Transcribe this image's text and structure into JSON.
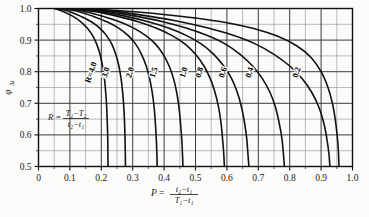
{
  "chart_data": {
    "type": "line",
    "title": "",
    "xlabel": "P = (t2-t1)/(T1-t1)",
    "ylabel": "phi_dt",
    "xlim": [
      0.0,
      1.0
    ],
    "ylim": [
      0.5,
      1.0
    ],
    "grid": true,
    "grid_major_x": 0.1,
    "grid_minor_x": 0.05,
    "grid_major_y": 0.1,
    "grid_minor_y": 0.05,
    "legend": "inline-curve-labels",
    "x_ticks": [
      "0",
      "0.1",
      "0.2",
      "0.3",
      "0.4",
      "0.5",
      "0.6",
      "0.7",
      "0.8",
      "0.9",
      "1.0"
    ],
    "x_tick_values": [
      0.0,
      0.1,
      0.2,
      0.3,
      0.4,
      0.5,
      0.6,
      0.7,
      0.8,
      0.9,
      1.0
    ],
    "y_ticks": [
      "0.5",
      "0.6",
      "0.7",
      "0.8",
      "0.9",
      "1.0"
    ],
    "y_tick_values": [
      0.5,
      0.6,
      0.7,
      0.8,
      0.9,
      1.0
    ],
    "series": [
      {
        "name": "R=4.0",
        "label": "R=4.0",
        "label_x": 0.175,
        "label_y": 0.795,
        "points": [
          [
            0.05,
            1.0
          ],
          [
            0.08,
            0.99
          ],
          [
            0.11,
            0.975
          ],
          [
            0.135,
            0.958
          ],
          [
            0.155,
            0.938
          ],
          [
            0.172,
            0.915
          ],
          [
            0.185,
            0.888
          ],
          [
            0.196,
            0.855
          ],
          [
            0.204,
            0.818
          ],
          [
            0.21,
            0.778
          ],
          [
            0.214,
            0.735
          ],
          [
            0.217,
            0.69
          ],
          [
            0.219,
            0.64
          ],
          [
            0.2205,
            0.59
          ],
          [
            0.221,
            0.54
          ],
          [
            0.2215,
            0.5
          ]
        ]
      },
      {
        "name": "3.0",
        "label": "3.0",
        "label_x": 0.222,
        "label_y": 0.795,
        "points": [
          [
            0.06,
            1.0
          ],
          [
            0.1,
            0.99
          ],
          [
            0.135,
            0.975
          ],
          [
            0.168,
            0.958
          ],
          [
            0.195,
            0.938
          ],
          [
            0.216,
            0.915
          ],
          [
            0.233,
            0.888
          ],
          [
            0.246,
            0.855
          ],
          [
            0.256,
            0.818
          ],
          [
            0.263,
            0.778
          ],
          [
            0.268,
            0.735
          ],
          [
            0.2715,
            0.69
          ],
          [
            0.274,
            0.64
          ],
          [
            0.2755,
            0.59
          ],
          [
            0.2765,
            0.54
          ],
          [
            0.277,
            0.5
          ]
        ]
      },
      {
        "name": "2.0",
        "label": "2.0",
        "label_x": 0.3,
        "label_y": 0.795,
        "points": [
          [
            0.075,
            1.0
          ],
          [
            0.128,
            0.99
          ],
          [
            0.175,
            0.975
          ],
          [
            0.218,
            0.958
          ],
          [
            0.255,
            0.938
          ],
          [
            0.285,
            0.915
          ],
          [
            0.309,
            0.888
          ],
          [
            0.328,
            0.855
          ],
          [
            0.343,
            0.818
          ],
          [
            0.354,
            0.778
          ],
          [
            0.362,
            0.735
          ],
          [
            0.368,
            0.69
          ],
          [
            0.372,
            0.64
          ],
          [
            0.375,
            0.59
          ],
          [
            0.377,
            0.54
          ],
          [
            0.378,
            0.5
          ]
        ]
      },
      {
        "name": "1.5",
        "label": "1.5",
        "label_x": 0.375,
        "label_y": 0.795,
        "points": [
          [
            0.088,
            1.0
          ],
          [
            0.15,
            0.99
          ],
          [
            0.207,
            0.975
          ],
          [
            0.258,
            0.958
          ],
          [
            0.303,
            0.938
          ],
          [
            0.341,
            0.915
          ],
          [
            0.372,
            0.888
          ],
          [
            0.397,
            0.855
          ],
          [
            0.416,
            0.818
          ],
          [
            0.43,
            0.778
          ],
          [
            0.44,
            0.735
          ],
          [
            0.447,
            0.69
          ],
          [
            0.452,
            0.64
          ],
          [
            0.456,
            0.59
          ],
          [
            0.4585,
            0.54
          ],
          [
            0.46,
            0.5
          ]
        ]
      },
      {
        "name": "1.0",
        "label": "1.0",
        "label_x": 0.47,
        "label_y": 0.795,
        "points": [
          [
            0.105,
            1.0
          ],
          [
            0.182,
            0.99
          ],
          [
            0.253,
            0.975
          ],
          [
            0.317,
            0.958
          ],
          [
            0.374,
            0.938
          ],
          [
            0.424,
            0.915
          ],
          [
            0.466,
            0.888
          ],
          [
            0.5,
            0.855
          ],
          [
            0.527,
            0.818
          ],
          [
            0.547,
            0.778
          ],
          [
            0.562,
            0.735
          ],
          [
            0.573,
            0.69
          ],
          [
            0.581,
            0.64
          ],
          [
            0.586,
            0.59
          ],
          [
            0.59,
            0.54
          ],
          [
            0.592,
            0.5
          ]
        ]
      },
      {
        "name": "0.8",
        "label": "0.8",
        "label_x": 0.52,
        "label_y": 0.795,
        "points": [
          [
            0.115,
            1.0
          ],
          [
            0.2,
            0.99
          ],
          [
            0.279,
            0.975
          ],
          [
            0.35,
            0.958
          ],
          [
            0.414,
            0.938
          ],
          [
            0.47,
            0.915
          ],
          [
            0.518,
            0.888
          ],
          [
            0.558,
            0.855
          ],
          [
            0.59,
            0.818
          ],
          [
            0.615,
            0.778
          ],
          [
            0.633,
            0.735
          ],
          [
            0.646,
            0.69
          ],
          [
            0.656,
            0.64
          ],
          [
            0.663,
            0.59
          ],
          [
            0.667,
            0.54
          ],
          [
            0.67,
            0.5
          ]
        ]
      },
      {
        "name": "0.6",
        "label": "0.6",
        "label_x": 0.595,
        "label_y": 0.795,
        "points": [
          [
            0.128,
            1.0
          ],
          [
            0.224,
            0.99
          ],
          [
            0.314,
            0.975
          ],
          [
            0.396,
            0.958
          ],
          [
            0.47,
            0.938
          ],
          [
            0.536,
            0.915
          ],
          [
            0.594,
            0.888
          ],
          [
            0.642,
            0.855
          ],
          [
            0.682,
            0.818
          ],
          [
            0.713,
            0.778
          ],
          [
            0.737,
            0.735
          ],
          [
            0.754,
            0.69
          ],
          [
            0.766,
            0.64
          ],
          [
            0.775,
            0.59
          ],
          [
            0.78,
            0.54
          ],
          [
            0.783,
            0.5
          ]
        ]
      },
      {
        "name": "0.4",
        "label": "0.4",
        "label_x": 0.68,
        "label_y": 0.795,
        "points": [
          [
            0.14,
            1.0
          ],
          [
            0.25,
            0.99
          ],
          [
            0.355,
            0.975
          ],
          [
            0.452,
            0.958
          ],
          [
            0.54,
            0.938
          ],
          [
            0.62,
            0.915
          ],
          [
            0.69,
            0.888
          ],
          [
            0.75,
            0.855
          ],
          [
            0.8,
            0.818
          ],
          [
            0.84,
            0.778
          ],
          [
            0.87,
            0.735
          ],
          [
            0.892,
            0.69
          ],
          [
            0.908,
            0.64
          ],
          [
            0.918,
            0.59
          ],
          [
            0.925,
            0.54
          ],
          [
            0.928,
            0.5
          ]
        ]
      },
      {
        "name": "0.2",
        "label": "0.2",
        "label_x": 0.83,
        "label_y": 0.795,
        "points": [
          [
            0.15,
            1.0
          ],
          [
            0.272,
            0.992
          ],
          [
            0.39,
            0.982
          ],
          [
            0.5,
            0.97
          ],
          [
            0.6,
            0.955
          ],
          [
            0.688,
            0.936
          ],
          [
            0.762,
            0.912
          ],
          [
            0.822,
            0.882
          ],
          [
            0.868,
            0.845
          ],
          [
            0.9,
            0.8
          ],
          [
            0.922,
            0.75
          ],
          [
            0.936,
            0.7
          ],
          [
            0.945,
            0.65
          ],
          [
            0.951,
            0.6
          ],
          [
            0.955,
            0.55
          ],
          [
            0.957,
            0.5
          ]
        ]
      }
    ],
    "annotations": [
      {
        "name": "r-definition",
        "text": "R = (T1-T2)/(t2-t1)",
        "symbol": "R",
        "numerator": "T1-T2",
        "denominator": "t2-t1",
        "x": 0.15,
        "y": 0.65
      }
    ]
  },
  "axis": {
    "y_label_symbol": "φ",
    "y_label_subscript": "Δt",
    "x_label_symbol": "P",
    "x_label_numerator": "t₂−t₁",
    "x_label_denominator": "T₁−t₁",
    "equals": "="
  },
  "annotation_r": {
    "symbol": "R",
    "equals": "=",
    "numerator": "T₁−T₂",
    "denominator": "t₂−t₁"
  },
  "style": {
    "curve_color": "#111111",
    "grid_major_color": "#3a3a3a",
    "grid_minor_color": "#8d8d8d",
    "frame_color": "#111111",
    "background": "#fbfbf9"
  }
}
